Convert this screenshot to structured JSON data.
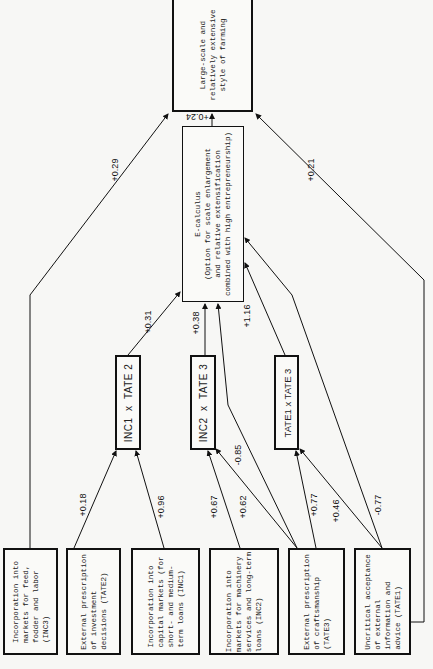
{
  "nodes": {
    "outcome": {
      "text": "Large-scale and\nrelatively extensive\nstyle of farming"
    },
    "ecalculus": {
      "text": "E-calculus\n(Option for scale enlargement\nand relative extensification\ncombined with high entrepreneurship)"
    },
    "inc1_tate2": {
      "text": "INC1  x  TATE 2"
    },
    "inc2_tate3": {
      "text": "INC2  x  TATE 3"
    },
    "tate1_tate3": {
      "text": "TATE1 x TATE 3"
    },
    "inc3": {
      "text": "Incorporation into\nmarkets for feed,\nfodder and labor\n(INC3)"
    },
    "tate2": {
      "text": "External prescription\nof investment\ndecisions (TATE2)"
    },
    "inc1": {
      "text": "Incorporation into\ncapital markets (for\nshort- and medium-\nterm loans (INC1)"
    },
    "inc2": {
      "text": "Incorporation into\nmarkets for machinery\nservices and long-term\nloans (INC2)"
    },
    "tate3": {
      "text": "External prescription\nof craftsmanship\n(TATE3)"
    },
    "tate1": {
      "text": "Uncritical acceptance\nof external\ninformation and\nadvice (TATE1)"
    }
  },
  "edges": [
    {
      "from": "ecalculus",
      "to": "outcome",
      "label": "+0.24"
    },
    {
      "from": "inc3",
      "to": "outcome",
      "label": "+0.29"
    },
    {
      "from": "tate1",
      "to": "outcome",
      "label": "+0.21"
    },
    {
      "from": "inc1_tate2",
      "to": "ecalculus",
      "label": "+0.31"
    },
    {
      "from": "inc2_tate3",
      "to": "ecalculus",
      "label": "+0.38"
    },
    {
      "from": "tate1_tate3",
      "to": "ecalculus",
      "label": "+1.16"
    },
    {
      "from": "tate3",
      "to": "ecalculus",
      "label": "-0.85"
    },
    {
      "from": "tate1",
      "to": "ecalculus",
      "label": "-0.77"
    },
    {
      "from": "tate2",
      "to": "inc1_tate2",
      "label": "+0.18"
    },
    {
      "from": "inc1",
      "to": "inc1_tate2",
      "label": "+0.96"
    },
    {
      "from": "inc2",
      "to": "inc2_tate3",
      "label": "+0.67"
    },
    {
      "from": "tate3",
      "to": "inc2_tate3",
      "label": "+0.62"
    },
    {
      "from": "tate3",
      "to": "tate1_tate3",
      "label": "+0.77"
    },
    {
      "from": "tate1",
      "to": "tate1_tate3",
      "label": "+0.46"
    }
  ]
}
